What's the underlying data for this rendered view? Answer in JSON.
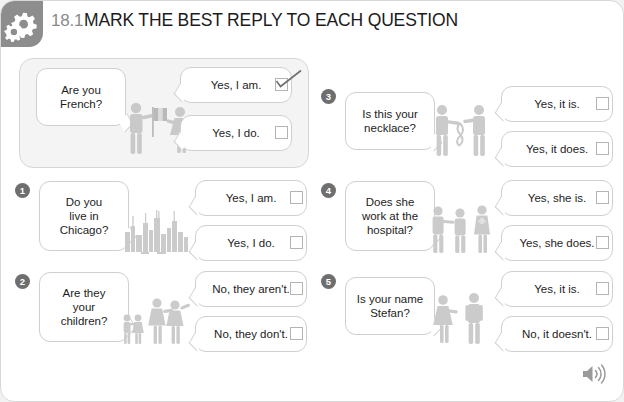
{
  "header": {
    "number": "18.1",
    "title": "MARK THE BEST REPLY TO EACH QUESTION",
    "gear_icon": "gears-icon"
  },
  "example": {
    "question": "Are you\nFrench?",
    "illustration": "man-with-french-flag-and-woman",
    "answers": [
      {
        "text": "Yes, I am.",
        "checked": true
      },
      {
        "text": "Yes, I do.",
        "checked": false
      }
    ]
  },
  "items": [
    {
      "number": "1",
      "question": "Do you\nlive in\nChicago?",
      "illustration": "chicago-skyline",
      "answers": [
        {
          "text": "Yes, I am.",
          "checked": false
        },
        {
          "text": "Yes, I do.",
          "checked": false
        }
      ]
    },
    {
      "number": "2",
      "question": "Are they\nyour\nchildren?",
      "illustration": "family-two-children-two-adults",
      "answers": [
        {
          "text": "No, they aren't.",
          "checked": false
        },
        {
          "text": "No, they don't.",
          "checked": false
        }
      ]
    },
    {
      "number": "3",
      "question": "Is this your\nnecklace?",
      "illustration": "two-people-with-necklace",
      "answers": [
        {
          "text": "Yes, it is.",
          "checked": false
        },
        {
          "text": "Yes, it does.",
          "checked": false
        }
      ]
    },
    {
      "number": "4",
      "question": "Does she\nwork at the\nhospital?",
      "illustration": "three-people-hospital",
      "answers": [
        {
          "text": "Yes, she is.",
          "checked": false
        },
        {
          "text": "Yes, she does.",
          "checked": false
        }
      ]
    },
    {
      "number": "5",
      "question": "Is your name\nStefan?",
      "illustration": "woman-and-man-talking",
      "answers": [
        {
          "text": "Yes, it is.",
          "checked": false
        },
        {
          "text": "No, it doesn't.",
          "checked": false
        }
      ]
    }
  ],
  "footer": {
    "audio_icon": "speaker-icon"
  },
  "colors": {
    "page_background": "#ffffff",
    "outer_background": "#f2f2f2",
    "gear_tab": "#8d8d8d",
    "example_background": "#f4f4f4",
    "badge": "#6e6e6e",
    "bubble_border": "#cfcfcf",
    "title": "#1b1b1b",
    "number": "#8a8a8a",
    "art": "#cfcfcf"
  }
}
